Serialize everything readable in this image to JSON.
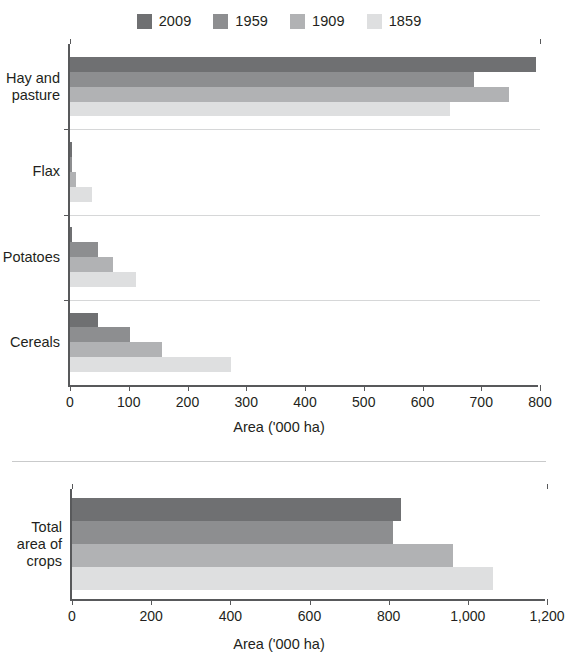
{
  "legend": {
    "items": [
      {
        "label": "2009",
        "color": "#6f7072"
      },
      {
        "label": "1959",
        "color": "#8d8e90"
      },
      {
        "label": "1909",
        "color": "#b1b2b4"
      },
      {
        "label": "1859",
        "color": "#dedfe0"
      }
    ]
  },
  "charts": {
    "top": {
      "xlabel": "Area ('000 ha)",
      "ticks": [
        "0",
        "100",
        "200",
        "300",
        "400",
        "500",
        "600",
        "700",
        "800"
      ],
      "categories": [
        "Hay and\npasture",
        "Flax",
        "Potatoes",
        "Cereals"
      ]
    },
    "bottom": {
      "xlabel": "Area ('000 ha)",
      "ticks": [
        "0",
        "200",
        "400",
        "600",
        "800",
        "1,000",
        "1,200"
      ],
      "categories": [
        "Total\narea of\ncrops"
      ]
    }
  },
  "chart_data": [
    {
      "type": "bar",
      "orientation": "horizontal",
      "title": "",
      "xlabel": "Area ('000 ha)",
      "ylabel": "",
      "categories": [
        "Hay and pasture",
        "Flax",
        "Potatoes",
        "Cereals"
      ],
      "series": [
        {
          "name": "2009",
          "color": "#6f7072",
          "values": [
            793,
            1,
            4,
            47
          ]
        },
        {
          "name": "1959",
          "color": "#8d8e90",
          "values": [
            688,
            2,
            47,
            102
          ]
        },
        {
          "name": "1909",
          "color": "#b1b2b4",
          "values": [
            747,
            10,
            74,
            157
          ]
        },
        {
          "name": "1859",
          "color": "#dedfe0",
          "values": [
            647,
            38,
            112,
            274
          ]
        }
      ],
      "xlim": [
        0,
        800
      ],
      "xticks": [
        0,
        100,
        200,
        300,
        400,
        500,
        600,
        700,
        800
      ],
      "grid": false,
      "legend_position": "top"
    },
    {
      "type": "bar",
      "orientation": "horizontal",
      "title": "",
      "xlabel": "Area ('000 ha)",
      "ylabel": "",
      "categories": [
        "Total area of crops"
      ],
      "series": [
        {
          "name": "2009",
          "color": "#6f7072",
          "values": [
            830
          ]
        },
        {
          "name": "1959",
          "color": "#8d8e90",
          "values": [
            812
          ]
        },
        {
          "name": "1909",
          "color": "#b1b2b4",
          "values": [
            962
          ]
        },
        {
          "name": "1859",
          "color": "#dedfe0",
          "values": [
            1063
          ]
        }
      ],
      "xlim": [
        0,
        1200
      ],
      "xticks": [
        0,
        200,
        400,
        600,
        800,
        1000,
        1200
      ],
      "grid": false,
      "legend_position": "top"
    }
  ]
}
